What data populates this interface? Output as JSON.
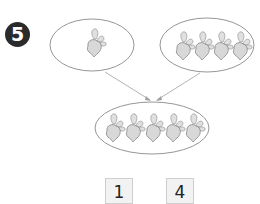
{
  "problem": {
    "number_label": "5"
  },
  "groups": {
    "left": {
      "count": 1,
      "item_icon": "radish-icon"
    },
    "right": {
      "count": 4,
      "item_icon": "radish-icon"
    },
    "combined": {
      "count": 5,
      "item_icon": "radish-icon"
    }
  },
  "answer_boxes": [
    {
      "value": "1"
    },
    {
      "value": "4"
    }
  ],
  "colors": {
    "badge_bg": "#2b2b2b",
    "ellipse_stroke": "#8a8a8a",
    "arrow_stroke": "#a0a0a0",
    "radish_fill": "#d8d8d8",
    "box_bg": "#f2f2f2"
  }
}
